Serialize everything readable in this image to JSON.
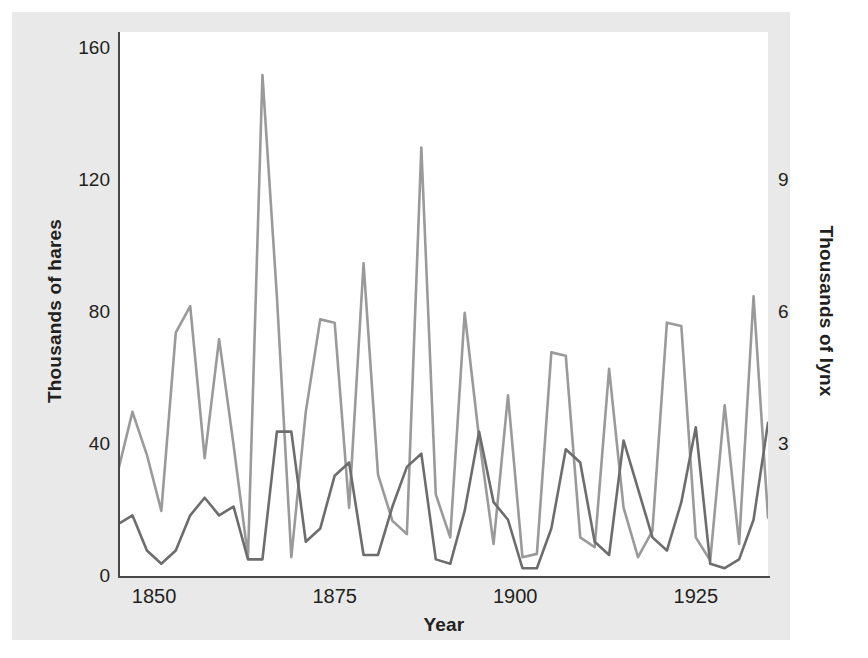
{
  "figure": {
    "background_color": "#e9e9e9",
    "plot_background_color": "#ffffff",
    "axis_color": "#4a4a4a"
  },
  "legend": {
    "title": "KEY",
    "position": "top-right-inside",
    "entries": [
      {
        "label": "Snowshoe hare",
        "color": "#9a9a9a",
        "icon": "line-swatch"
      },
      {
        "label": "Lynx",
        "color": "#6d6d6d",
        "icon": "line-swatch"
      }
    ]
  },
  "illustration": {
    "name": "lynx-stalking-snowshoe-hare-in-snow",
    "predator": "lynx",
    "prey": "snowshoe hare",
    "predator_color": "#8a8a8a",
    "prey_color": "#fdfdfd",
    "snow_line_color": "#555555"
  },
  "axes": {
    "x": {
      "label": "Year",
      "ticks": [
        "1850",
        "1875",
        "1900",
        "1925"
      ],
      "tick_values": [
        1850,
        1875,
        1900,
        1925
      ],
      "range": [
        1845,
        1935
      ]
    },
    "y_left": {
      "label": "Thousands of hares",
      "ticks": [
        "0",
        "40",
        "80",
        "120",
        "160"
      ],
      "tick_values": [
        0,
        40,
        80,
        120,
        160
      ],
      "range": [
        0,
        165
      ]
    },
    "y_right": {
      "label": "Thousands of lynx",
      "ticks": [
        "3",
        "6",
        "9"
      ],
      "tick_values": [
        3,
        6,
        9
      ],
      "range": [
        0,
        12.375
      ]
    }
  },
  "chart_data": {
    "type": "line",
    "title": "",
    "xlabel": "Year",
    "ylabel": "Thousands of hares",
    "ylabel_secondary": "Thousands of lynx",
    "xlim": [
      1845,
      1935
    ],
    "ylim": [
      0,
      165
    ],
    "ylim_secondary": [
      0,
      12.375
    ],
    "grid": false,
    "legend_position": "upper right",
    "x": [
      1845,
      1847,
      1849,
      1851,
      1853,
      1855,
      1857,
      1859,
      1861,
      1863,
      1865,
      1867,
      1869,
      1871,
      1873,
      1875,
      1877,
      1879,
      1881,
      1883,
      1885,
      1887,
      1889,
      1891,
      1893,
      1895,
      1897,
      1899,
      1901,
      1903,
      1905,
      1907,
      1909,
      1911,
      1913,
      1915,
      1917,
      1919,
      1921,
      1923,
      1925,
      1927,
      1929,
      1931,
      1933,
      1935
    ],
    "series": [
      {
        "name": "Snowshoe hare",
        "units": "thousands",
        "axis": "left",
        "color": "#9a9a9a",
        "values": [
          32,
          50,
          37,
          20,
          74,
          82,
          36,
          72,
          40,
          6,
          152,
          85,
          6,
          50,
          78,
          77,
          21,
          95,
          31,
          17,
          13,
          130,
          25,
          12,
          80,
          42,
          10,
          55,
          6,
          7,
          68,
          67,
          12,
          9,
          63,
          21,
          6,
          14,
          77,
          76,
          12,
          5,
          52,
          10,
          85,
          18
        ]
      },
      {
        "name": "Lynx",
        "units": "thousands",
        "axis": "right",
        "color": "#6d6d6d",
        "values": [
          1.2,
          1.4,
          0.6,
          0.3,
          0.6,
          1.4,
          1.8,
          1.4,
          1.6,
          0.4,
          0.4,
          3.3,
          3.3,
          0.8,
          1.1,
          2.3,
          2.6,
          0.5,
          0.5,
          1.6,
          2.5,
          2.8,
          0.4,
          0.3,
          1.5,
          3.3,
          1.7,
          1.3,
          0.2,
          0.2,
          1.1,
          2.9,
          2.6,
          0.8,
          0.5,
          3.1,
          2.0,
          0.9,
          0.6,
          1.7,
          3.4,
          0.3,
          0.2,
          0.4,
          1.3,
          3.5
        ]
      }
    ]
  }
}
